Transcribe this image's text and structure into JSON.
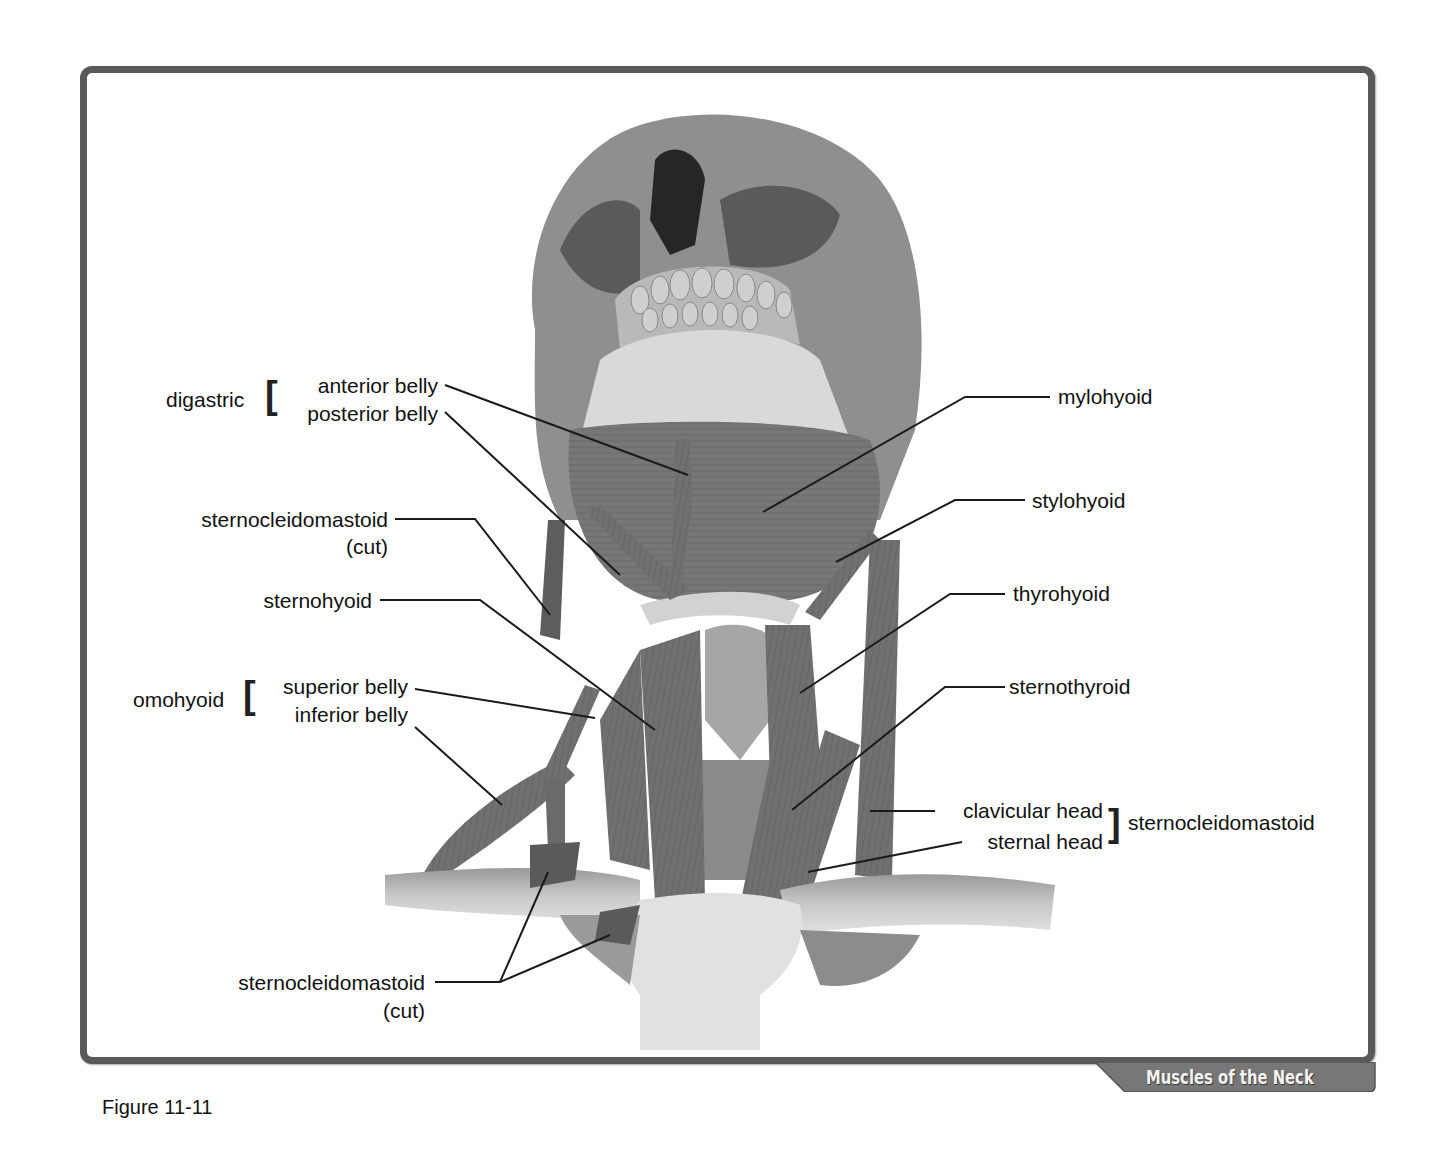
{
  "figure": {
    "caption": "Figure 11-11",
    "title_tab": "Muscles of the Neck",
    "colors": {
      "frame": "#5a5a5a",
      "tab_fill": "#777777",
      "tab_text": "#f4f4f4",
      "muscle": "#6e6e6e",
      "bone": "#d8d8d8",
      "label_text": "#111111"
    }
  },
  "labels": {
    "left": {
      "digastric": {
        "group": "digastric",
        "parts": [
          "anterior belly",
          "posterior belly"
        ]
      },
      "scm_cut_upper": {
        "line1": "sternocleidomastoid",
        "line2": "(cut)"
      },
      "sternohyoid": "sternohyoid",
      "omohyoid": {
        "group": "omohyoid",
        "parts": [
          "superior belly",
          "inferior belly"
        ]
      },
      "scm_cut_lower": {
        "line1": "sternocleidomastoid",
        "line2": "(cut)"
      }
    },
    "right": {
      "mylohyoid": "mylohyoid",
      "stylohyoid": "stylohyoid",
      "thyrohyoid": "thyrohyoid",
      "sternothyroid": "sternothyroid",
      "scm_heads": {
        "parts": [
          "clavicular head",
          "sternal head"
        ],
        "group": "sternocleidomastoid"
      }
    }
  }
}
